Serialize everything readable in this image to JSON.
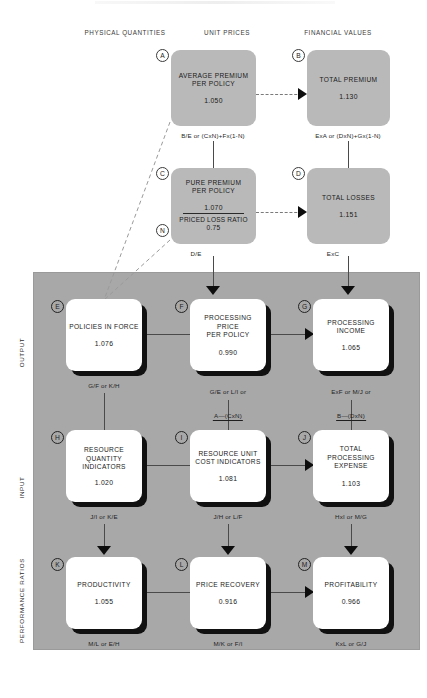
{
  "headers": [
    {
      "label": "PHYSICAL QUANTITIES",
      "x": 125,
      "y": 29
    },
    {
      "label": "UNIT PRICES",
      "x": 227,
      "y": 29
    },
    {
      "label": "FINANCIAL VALUES",
      "x": 338,
      "y": 29
    }
  ],
  "bands": [
    {
      "label": "OUTPUT",
      "cx": 21,
      "cy": 352
    },
    {
      "label": "INPUT",
      "cx": 21,
      "cy": 487
    },
    {
      "label": "PERFORMANCE RATIOS",
      "cx": 21,
      "cy": 600
    }
  ],
  "nodes": [
    {
      "tag": "A",
      "title": "AVERAGE PREMIUM\nPER POLICY",
      "value": "1.050",
      "formula": "B/E or (CxN)+Fx(1-N)",
      "style": "gray",
      "x": 171,
      "y": 50,
      "w": 85,
      "h": 76,
      "tag_x": 156,
      "tag_y": 49,
      "formula_cx": 213,
      "formula_y": 132
    },
    {
      "tag": "B",
      "title": "TOTAL PREMIUM",
      "value": "1.130",
      "formula": "ExA or (DxN)+Gx(1-N)",
      "style": "gray",
      "x": 307,
      "y": 50,
      "w": 83,
      "h": 76,
      "tag_x": 292,
      "tag_y": 49,
      "formula_cx": 348,
      "formula_y": 132
    },
    {
      "tag": "C",
      "title": "PURE PREMIUM\nPER POLICY",
      "value": "1.070",
      "sub_title": "PRICED LOSS RATIO",
      "sub_value": "0.75",
      "sub_tag": "N",
      "formula": "D/E",
      "style": "gray-split",
      "x": 171,
      "y": 168,
      "w": 85,
      "h": 76,
      "tag_x": 156,
      "tag_y": 167,
      "sub_tag_x": 156,
      "sub_tag_y": 224,
      "formula_cx": 196,
      "formula_y": 250
    },
    {
      "tag": "D",
      "title": "TOTAL LOSSES",
      "value": "1.151",
      "formula": "ExC",
      "style": "gray",
      "x": 307,
      "y": 168,
      "w": 83,
      "h": 76,
      "tag_x": 292,
      "tag_y": 167,
      "formula_cx": 333,
      "formula_y": 250
    },
    {
      "tag": "E",
      "title": "POLICIES IN FORCE",
      "value": "1.076",
      "formula": "G/F or K/H",
      "style": "white",
      "x": 66,
      "y": 299,
      "w": 76,
      "h": 72,
      "tag_x": 51,
      "tag_y": 300,
      "formula_cx": 104,
      "formula_y": 382
    },
    {
      "tag": "F",
      "title": "PROCESSING PRICE\nPER POLICY",
      "value": "0.990",
      "formula_pre": "G/E or L/I or",
      "formula_num": "A—(CxN)",
      "formula_den": "1—N",
      "style": "white",
      "x": 190,
      "y": 299,
      "w": 76,
      "h": 72,
      "tag_x": 175,
      "tag_y": 300,
      "formula_cx": 228,
      "formula_y": 382
    },
    {
      "tag": "G",
      "title": "PROCESSING\nINCOME",
      "value": "1.065",
      "formula_pre": "ExF or M/J or",
      "formula_num": "B—(DxN)",
      "formula_den": "1—N",
      "style": "white",
      "x": 313,
      "y": 299,
      "w": 76,
      "h": 72,
      "tag_x": 298,
      "tag_y": 300,
      "formula_cx": 351,
      "formula_y": 382
    },
    {
      "tag": "H",
      "title": "RESOURCE\nQUANTITY\nINDICATORS",
      "value": "1.020",
      "formula": "J/I or K/E",
      "style": "white",
      "x": 66,
      "y": 430,
      "w": 76,
      "h": 72,
      "tag_x": 51,
      "tag_y": 431,
      "formula_cx": 104,
      "formula_y": 513
    },
    {
      "tag": "I",
      "title": "RESOURCE UNIT\nCOST INDICATORS",
      "value": "1.081",
      "formula": "J/H or L/F",
      "style": "white",
      "x": 190,
      "y": 430,
      "w": 76,
      "h": 72,
      "tag_x": 175,
      "tag_y": 431,
      "formula_cx": 228,
      "formula_y": 513
    },
    {
      "tag": "J",
      "title": "TOTAL PROCESSING\nEXPENSE",
      "value": "1.103",
      "formula": "HxI or M/G",
      "style": "white",
      "x": 313,
      "y": 430,
      "w": 76,
      "h": 72,
      "tag_x": 298,
      "tag_y": 431,
      "formula_cx": 351,
      "formula_y": 513
    },
    {
      "tag": "K",
      "title": "PRODUCTIVITY",
      "value": "1.055",
      "formula": "M/L or E/H",
      "style": "white",
      "x": 66,
      "y": 557,
      "w": 76,
      "h": 72,
      "tag_x": 51,
      "tag_y": 558,
      "formula_cx": 104,
      "formula_y": 640
    },
    {
      "tag": "L",
      "title": "PRICE RECOVERY",
      "value": "0.916",
      "formula": "M/K or F/I",
      "style": "white",
      "x": 190,
      "y": 557,
      "w": 76,
      "h": 72,
      "tag_x": 175,
      "tag_y": 558,
      "formula_cx": 228,
      "formula_y": 640
    },
    {
      "tag": "M",
      "title": "PROFITABILITY",
      "value": "0.966",
      "formula": "KxL or G/J",
      "style": "white",
      "x": 313,
      "y": 557,
      "w": 76,
      "h": 72,
      "tag_x": 298,
      "tag_y": 558,
      "formula_cx": 351,
      "formula_y": 640
    }
  ],
  "colors": {
    "panel": "#a8a8a8",
    "gray_box": "#b9b9b9",
    "white_box": "#ffffff",
    "shadow": "#111111",
    "connector": "#4a4a4a",
    "dashed": "#7a7a7a"
  }
}
